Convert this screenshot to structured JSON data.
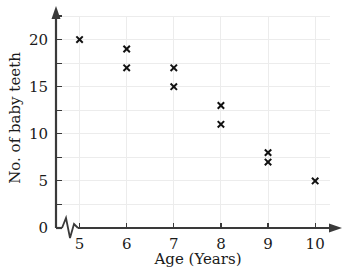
{
  "chart_data": {
    "type": "scatter",
    "title": "",
    "xlabel": "Age (Years)",
    "ylabel": "No. of baby teeth",
    "xlim": [
      4.5,
      10.4
    ],
    "ylim": [
      0,
      22.5
    ],
    "xticks": [
      5,
      6,
      7,
      8,
      9,
      10
    ],
    "yticks": [
      0,
      5,
      10,
      15,
      20
    ],
    "xtick_labels": [
      "5",
      "6",
      "7",
      "8",
      "9",
      "10"
    ],
    "ytick_labels": [
      "0",
      "5",
      "10",
      "15",
      "20"
    ],
    "grid": true,
    "grid_x_step": 1,
    "grid_y_step": 2.5,
    "axis_break": "x-axis-zigzag-near-origin",
    "marker": "x",
    "marker_color": "#111111",
    "grid_color": "#ececec",
    "axis_color": "#3a3a3a",
    "points": [
      {
        "x": 5,
        "y": 20
      },
      {
        "x": 6,
        "y": 19
      },
      {
        "x": 6,
        "y": 17
      },
      {
        "x": 7,
        "y": 17
      },
      {
        "x": 7,
        "y": 15
      },
      {
        "x": 8,
        "y": 13
      },
      {
        "x": 8,
        "y": 11
      },
      {
        "x": 9,
        "y": 8
      },
      {
        "x": 9,
        "y": 7
      },
      {
        "x": 10,
        "y": 5
      }
    ]
  },
  "axes": {
    "x_title": "Age (Years)",
    "y_title": "No. of baby teeth"
  }
}
